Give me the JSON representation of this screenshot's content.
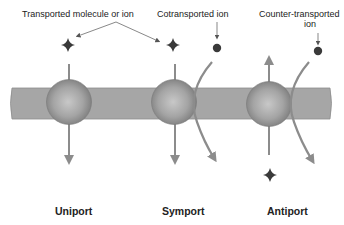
{
  "labels": {
    "transported": "Transported molecule or ion",
    "cotransported": "Cotransported ion",
    "counter_line1": "Counter-transported",
    "counter_line2": "ion"
  },
  "panels": [
    {
      "name": "Uniport"
    },
    {
      "name": "Symport"
    },
    {
      "name": "Antiport"
    }
  ],
  "colors": {
    "membrane": "#a3a3a3",
    "membrane_edge": "#8a8a8a",
    "protein": "#9a9a9a",
    "arrow": "#8c8c8c",
    "molecule": "#3a3a3a",
    "ion": "#3a3a3a"
  }
}
